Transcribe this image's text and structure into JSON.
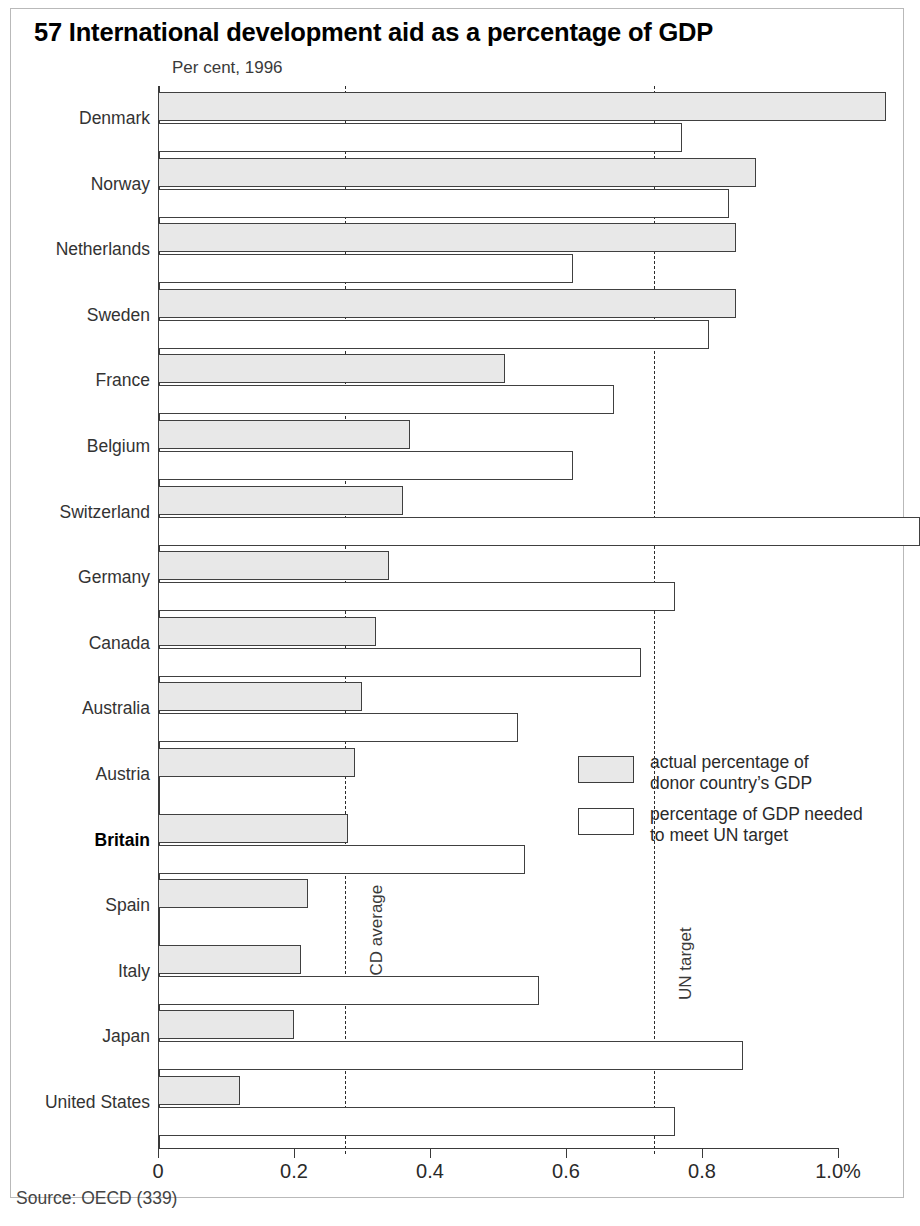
{
  "figure": {
    "number": "57",
    "title": "57 International development aid as a percentage of GDP",
    "subtitle": "Per cent, 1996",
    "source": "Source: OECD (339)"
  },
  "legend": {
    "items": [
      {
        "key": "actual",
        "label_line1": "actual percentage of",
        "label_line2": "donor country’s GDP"
      },
      {
        "key": "target",
        "label_line1": "percentage of GDP needed",
        "label_line2": "to meet UN target"
      }
    ]
  },
  "reference_lines": [
    {
      "name": "oecd-average",
      "label": "OECD average",
      "value": 0.275
    },
    {
      "name": "un-target",
      "label": "UN target",
      "value": 0.73
    }
  ],
  "axis": {
    "ticks": [
      "0",
      "0.2",
      "0.4",
      "0.6",
      "0.8",
      "1.0%"
    ],
    "tick_values": [
      0,
      0.2,
      0.4,
      0.6,
      0.8,
      1.0
    ],
    "min": 0,
    "max": 1.0
  },
  "chart_data": {
    "type": "bar",
    "orientation": "horizontal",
    "title": "57 International development aid as a percentage of GDP",
    "subtitle": "Per cent, 1996",
    "xlabel": "Per cent, 1996",
    "ylabel": "",
    "xlim": [
      0,
      1.0
    ],
    "grid": false,
    "legend_position": "inside-right",
    "categories": [
      "Denmark",
      "Norway",
      "Netherlands",
      "Sweden",
      "France",
      "Belgium",
      "Switzerland",
      "Germany",
      "Canada",
      "Australia",
      "Austria",
      "Britain",
      "Spain",
      "Italy",
      "Japan",
      "United States"
    ],
    "highlighted_category": "Britain",
    "series": [
      {
        "name": "actual percentage of donor country's GDP",
        "key": "actual",
        "color": "#e8e8e8",
        "values": [
          1.07,
          0.88,
          0.85,
          0.85,
          0.51,
          0.37,
          0.36,
          0.34,
          0.32,
          0.3,
          0.29,
          0.28,
          0.22,
          0.21,
          0.2,
          0.12
        ]
      },
      {
        "name": "percentage of GDP needed to meet UN target",
        "key": "target",
        "color": "#ffffff",
        "values": [
          0.77,
          0.84,
          0.61,
          0.81,
          0.67,
          0.61,
          1.12,
          0.76,
          0.71,
          0.53,
          null,
          0.54,
          null,
          0.56,
          0.86,
          0.76
        ]
      }
    ],
    "annotations": [
      {
        "text": "OECD average",
        "x": 0.275,
        "orientation": "vertical",
        "line": "dashed"
      },
      {
        "text": "UN target",
        "x": 0.73,
        "orientation": "vertical",
        "line": "dashed"
      }
    ]
  }
}
